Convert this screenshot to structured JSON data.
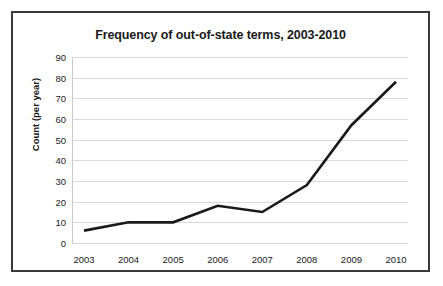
{
  "chart_data": {
    "type": "line",
    "title": "Frequency of out-of-state terms, 2003-2010",
    "xlabel": "",
    "ylabel": "Count (per year)",
    "categories": [
      "2003",
      "2004",
      "2005",
      "2006",
      "2007",
      "2008",
      "2009",
      "2010"
    ],
    "values": [
      6,
      10,
      10,
      18,
      15,
      28,
      57,
      78
    ],
    "series": [
      {
        "name": "Count (per year)",
        "values": [
          6,
          10,
          10,
          18,
          15,
          28,
          57,
          78
        ]
      }
    ],
    "x": [
      2003,
      2004,
      2005,
      2006,
      2007,
      2008,
      2009,
      2010
    ],
    "ylim": [
      0,
      90
    ],
    "ytick_labels": [
      "90",
      "80",
      "70",
      "60",
      "50",
      "40",
      "30",
      "20",
      "10",
      "0"
    ],
    "ytick_values": [
      90,
      80,
      70,
      60,
      50,
      40,
      30,
      20,
      10,
      0
    ],
    "grid": true,
    "legend": false,
    "legend_position": "none",
    "colors": {
      "line": "#1a1a1a",
      "gridline": "#d9d9d9",
      "axis": "#c9c9c9",
      "border": "#3a3a3a",
      "background": "#ffffff",
      "text": "#1a1a1a"
    }
  }
}
